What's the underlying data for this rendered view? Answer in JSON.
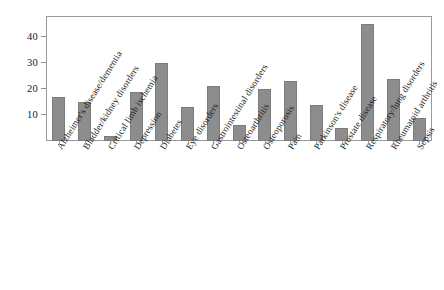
{
  "chart_data": {
    "type": "bar",
    "title": "",
    "subtitle": "",
    "xlabel": "",
    "ylabel": "",
    "ylim": [
      0,
      48
    ],
    "yticks": [
      10,
      20,
      30,
      40
    ],
    "grid": false,
    "legend": null,
    "bar_color": "#8d8d8d",
    "bar_edge_color": "#7c7c7c",
    "axis_color": "#9a9a9a",
    "background_color": "#ffffff",
    "categories": [
      "Alzheimer's disease/dementia",
      "Bladder/kidney disorders",
      "Critical limb ischemia",
      "Depression",
      "Diabetes",
      "Eye disorders",
      "Gastrointestinal disorders",
      "Osteoarthritis",
      "Osteoporosis",
      "Pain",
      "Parkinson's disease",
      "Prostate disease",
      "Respiratory/lung disorders",
      "Rheumatoid arthritis",
      "Sepsis"
    ],
    "values": [
      17,
      15,
      2,
      19,
      30,
      13,
      21,
      6,
      20,
      23,
      14,
      5,
      45,
      24,
      9
    ]
  }
}
